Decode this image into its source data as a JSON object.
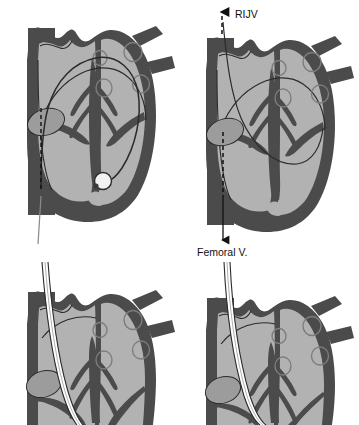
{
  "figure": {
    "panel_count": 4
  },
  "colors": {
    "background": "#ffffff",
    "myocardium_dark": "#4b4b4b",
    "chamber_light": "#b2b2b2",
    "chamber_mid": "#9c9c9c",
    "outline": "#2b2b2b",
    "catheter_line": "#2b2b2b",
    "catheter_fill": "#ffffff",
    "balloon_fill": "#f2f2f2",
    "label_text": "#111111",
    "arrow": "#111111"
  },
  "panels": [
    {
      "id": "panel-top-left",
      "name": "balloon-tip-catheter-panel",
      "description": "Heart four-chamber view with balloon-tipped catheter advanced from inferior vena cava to right ventricle",
      "features": {
        "catheter_present": true,
        "balloon_tip": true,
        "dashed_guide": true,
        "labels": []
      }
    },
    {
      "id": "panel-top-right",
      "name": "venous-access-routes-panel",
      "description": "Heart four-chamber view showing bidirectional venous access routes with labeled arrows",
      "features": {
        "catheter_present": false,
        "balloon_tip": false,
        "dashed_guide": true,
        "labels": [
          "RIJV",
          "Femoral V."
        ]
      }
    },
    {
      "id": "panel-bottom-left",
      "name": "sheath-advance-panel-a",
      "description": "Cropped heart view with introducer sheath advanced through superior vena cava into right atrium",
      "features": {
        "catheter_present": true,
        "balloon_tip": false,
        "dashed_guide": false,
        "labels": []
      }
    },
    {
      "id": "panel-bottom-right",
      "name": "sheath-advance-panel-b",
      "description": "Cropped heart view with introducer sheath advanced deeper toward tricuspid valve",
      "features": {
        "catheter_present": true,
        "balloon_tip": false,
        "dashed_guide": false,
        "labels": []
      }
    }
  ],
  "annotations": {
    "rijv": {
      "label": "RIJV",
      "full_name": "Right Internal Jugular Vein",
      "arrow_direction": "up",
      "x": 221,
      "y": 17
    },
    "femoral": {
      "label": "Femoral V.",
      "full_name": "Femoral Vein",
      "arrow_direction": "down",
      "x": 198,
      "y": 252
    }
  }
}
